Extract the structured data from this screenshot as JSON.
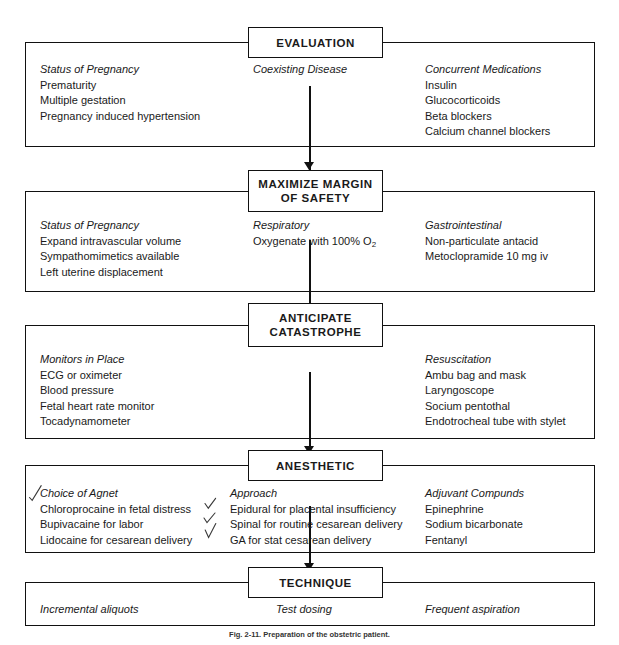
{
  "figure": {
    "caption": "Fig. 2-11. Preparation of the obstetric patient.",
    "line_color": "#111111",
    "background": "#ffffff",
    "pen_color": "#3a3a3a"
  },
  "stages": [
    {
      "id": "evaluation",
      "title": "EVALUATION",
      "title_lines": [
        "EVALUATION"
      ],
      "columns": [
        {
          "id": "status-of-pregnancy",
          "heading": "Status of Pregnancy",
          "items": [
            "Prematurity",
            "Multiple gestation",
            "Pregnancy induced hypertension"
          ]
        },
        {
          "id": "coexisting-disease",
          "heading": "Coexisting Disease",
          "items": []
        },
        {
          "id": "concurrent-medications",
          "heading": "Concurrent Medications",
          "items": [
            "Insulin",
            "Glucocorticoids",
            "Beta blockers",
            "Calcium channel blockers"
          ]
        }
      ]
    },
    {
      "id": "maximize-margin-of-safety",
      "title": "MAXIMIZE MARGIN OF SAFETY",
      "title_lines": [
        "MAXIMIZE MARGIN",
        "OF SAFETY"
      ],
      "columns": [
        {
          "id": "status-of-pregnancy-2",
          "heading": "Status of Pregnancy",
          "items": [
            "Expand intravascular volume",
            "Sympathomimetics available",
            "Left uterine displacement"
          ]
        },
        {
          "id": "respiratory",
          "heading": "Respiratory",
          "items": [
            "Oxygenate with 100% O2"
          ],
          "items_html": [
            "Oxygenate with 100% O<sub>2</sub>"
          ]
        },
        {
          "id": "gastrointestinal",
          "heading": "Gastrointestinal",
          "items": [
            "Non-particulate antacid",
            "Metoclopramide 10 mg iv"
          ]
        }
      ]
    },
    {
      "id": "anticipate-catastrophe",
      "title": "ANTICIPATE CATASTROPHE",
      "title_lines": [
        "ANTICIPATE",
        "CATASTROPHE"
      ],
      "columns": [
        {
          "id": "monitors-in-place",
          "heading": "Monitors in Place",
          "items": [
            "ECG or oximeter",
            "Blood pressure",
            "Fetal heart rate monitor",
            "Tocadynamometer"
          ]
        },
        {
          "id": "middle-empty",
          "heading": "",
          "items": []
        },
        {
          "id": "resuscitation",
          "heading": "Resuscitation",
          "items": [
            "Ambu bag and mask",
            "Laryngoscope",
            "Socium pentothal",
            "Endotrocheal tube with stylet"
          ]
        }
      ]
    },
    {
      "id": "anesthetic",
      "title": "ANESTHETIC",
      "title_lines": [
        "ANESTHETIC"
      ],
      "columns": [
        {
          "id": "choice-of-agent",
          "heading": "Choice of Agnet",
          "items": [
            "Chloroprocaine in fetal distress",
            "Bupivacaine for labor",
            "Lidocaine for cesarean delivery"
          ]
        },
        {
          "id": "approach",
          "heading": "Approach",
          "items": [
            "Epidural for placental insufficiency",
            "Spinal for routine cesarean delivery",
            "GA for stat cesarean delivery"
          ]
        },
        {
          "id": "adjuvant-compounds",
          "heading": "Adjuvant Compunds",
          "items": [
            "Epinephrine",
            "Sodium bicarbonate",
            "Fentanyl"
          ]
        }
      ]
    },
    {
      "id": "technique",
      "title": "TECHNIQUE",
      "title_lines": [
        "TECHNIQUE"
      ],
      "row_items": [
        "Incremental aliquots",
        "Test dosing",
        "Frequent aspiration"
      ]
    }
  ],
  "annotations": {
    "pen_marks": [
      {
        "id": "check-choice-of-agent",
        "label": "check mark beside Choice of Agnet"
      },
      {
        "id": "check-epidural",
        "label": "check mark beside Epidural for placental insufficiency"
      },
      {
        "id": "check-spinal",
        "label": "check mark beside Spinal for routine cesarean delivery"
      },
      {
        "id": "check-ga",
        "label": "check mark beside GA for stat cesarean delivery"
      }
    ]
  }
}
